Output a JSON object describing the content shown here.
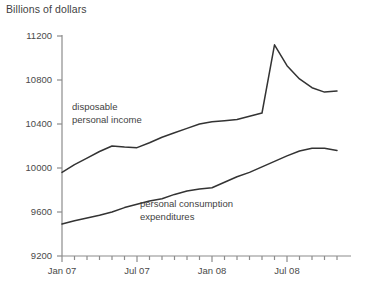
{
  "chart_data": {
    "type": "line",
    "title": "Billions of dollars",
    "xlabel": "",
    "ylabel": "Billions of dollars",
    "ylim": [
      9200,
      11200
    ],
    "yticks": [
      9200,
      9600,
      10000,
      10400,
      10800,
      11200
    ],
    "ytick_labels": [
      "9200",
      "9600",
      "10000",
      "10400",
      "10800",
      "11200"
    ],
    "xlim": [
      "Jan 07",
      "Nov 08"
    ],
    "xtick_labels": [
      "Jan 07",
      "Jul 07",
      "Jan 08",
      "Jul 08"
    ],
    "xtick_positions": [
      0,
      6,
      12,
      18
    ],
    "minor_tick_count": 23,
    "grid": false,
    "legend": "inline-annotations",
    "x": [
      "Jan 07",
      "Feb 07",
      "Mar 07",
      "Apr 07",
      "May 07",
      "Jun 07",
      "Jul 07",
      "Aug 07",
      "Sep 07",
      "Oct 07",
      "Nov 07",
      "Dec 07",
      "Jan 08",
      "Feb 08",
      "Mar 08",
      "Apr 08",
      "May 08",
      "Jun 08",
      "Jul 08",
      "Aug 08",
      "Sep 08",
      "Oct 08",
      "Nov 08"
    ],
    "series": [
      {
        "name": "disposable personal income",
        "values": [
          9960,
          10030,
          10090,
          10150,
          10200,
          10190,
          10185,
          10230,
          10280,
          10320,
          10360,
          10400,
          10420,
          10430,
          10440,
          10470,
          10500,
          11120,
          10930,
          10810,
          10730,
          10690,
          10700
        ],
        "color": "#333333"
      },
      {
        "name": "personal consumption expenditures",
        "values": [
          9490,
          9520,
          9545,
          9570,
          9600,
          9640,
          9670,
          9700,
          9720,
          9760,
          9790,
          9810,
          9820,
          9870,
          9920,
          9960,
          10010,
          10060,
          10110,
          10155,
          10180,
          10180,
          10160
        ],
        "color": "#333333"
      }
    ],
    "annotations": [
      {
        "text_line1": "disposable",
        "text_line2": "personal income",
        "series": "disposable personal income"
      },
      {
        "text_line1": "personal consumption",
        "text_line2": "expenditures",
        "series": "personal consumption expenditures"
      }
    ]
  },
  "axis": {
    "axis_color": "#8c8c8c",
    "line_color": "#333333"
  }
}
